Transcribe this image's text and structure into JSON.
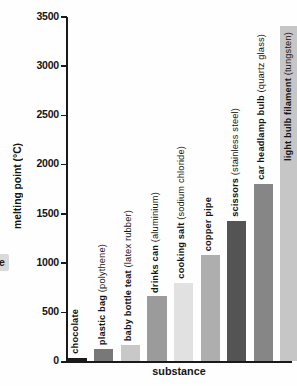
{
  "page": {
    "edge_fragment_text": "e"
  },
  "chart_data": {
    "type": "bar",
    "title": "",
    "xlabel": "substance",
    "ylabel": "melting point (°C)",
    "ylim": [
      0,
      3500
    ],
    "yticks": [
      0,
      500,
      1000,
      1500,
      2000,
      2500,
      3000,
      3500
    ],
    "grid": false,
    "legend": false,
    "categories": [
      "chocolate",
      "plastic bag (polythene)",
      "baby bottle teat (latex rubber)",
      "drinks can (aluminium)",
      "cooking salt (sodium chloride)",
      "copper pipe",
      "scissors (stainless steel)",
      "car headlamp bulb (quartz glass)",
      "light bulb filament (tungsten)"
    ],
    "values": [
      35,
      130,
      170,
      660,
      800,
      1080,
      1430,
      1800,
      3410
    ],
    "bars": [
      {
        "name": "chocolate",
        "detail": "",
        "value": 35,
        "color": "#1b1b1b",
        "label_inside": false
      },
      {
        "name": "plastic bag",
        "detail": "(polythene)",
        "value": 130,
        "color": "#787878",
        "label_inside": false
      },
      {
        "name": "baby bottle teat",
        "detail": "(latex rubber)",
        "value": 170,
        "color": "#c8c8c8",
        "label_inside": false
      },
      {
        "name": "drinks can",
        "detail": "(aluminium)",
        "value": 660,
        "color": "#9b9b9b",
        "label_inside": false
      },
      {
        "name": "cooking salt",
        "detail": "(sodium chloride)",
        "value": 800,
        "color": "#e1e1e1",
        "label_inside": false
      },
      {
        "name": "copper pipe",
        "detail": "",
        "value": 1080,
        "color": "#aeaeae",
        "label_inside": false
      },
      {
        "name": "scissors",
        "detail": "(stainless steel)",
        "value": 1430,
        "color": "#545454",
        "label_inside": false
      },
      {
        "name": "car headlamp bulb",
        "detail": "(quartz glass)",
        "value": 1800,
        "color": "#868686",
        "label_inside": false
      },
      {
        "name": "light bulb filament",
        "detail": "(tungsten)",
        "value": 3410,
        "color": "#c6c6c6",
        "label_inside": true
      }
    ]
  }
}
